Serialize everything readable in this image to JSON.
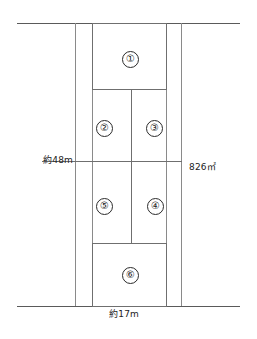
{
  "figure": {
    "type": "land-subdivision-plan",
    "background_color": "#ffffff",
    "line_color": "#6f6f6f",
    "text_color": "#222222"
  },
  "parcels": [
    {
      "id": "1",
      "label": "①"
    },
    {
      "id": "2",
      "label": "②"
    },
    {
      "id": "3",
      "label": "③"
    },
    {
      "id": "4",
      "label": "④"
    },
    {
      "id": "5",
      "label": "⑤"
    },
    {
      "id": "6",
      "label": "⑥"
    }
  ],
  "dimensions": {
    "left_length": "約48m",
    "bottom_width": "約17m",
    "total_area": "826㎡"
  }
}
